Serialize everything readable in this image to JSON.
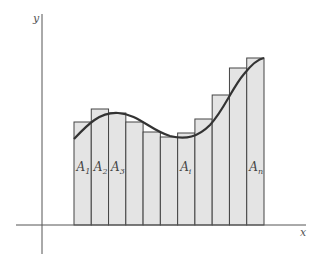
{
  "diagram": {
    "type": "riemann-sum-rectangles",
    "axes": {
      "x_label": "x",
      "y_label": "y"
    },
    "bars": [
      {
        "index": 1,
        "label_main": "A",
        "label_sub": "1",
        "top": 122
      },
      {
        "index": 2,
        "label_main": "A",
        "label_sub": "2",
        "top": 109
      },
      {
        "index": 3,
        "label_main": "A",
        "label_sub": "3",
        "top": 113
      },
      {
        "index": 4,
        "label_main": "",
        "label_sub": "",
        "top": 122
      },
      {
        "index": 5,
        "label_main": "",
        "label_sub": "",
        "top": 132
      },
      {
        "index": 6,
        "label_main": "",
        "label_sub": "",
        "top": 137
      },
      {
        "index": 7,
        "label_main": "A",
        "label_sub": "i",
        "top": 133
      },
      {
        "index": 8,
        "label_main": "",
        "label_sub": "",
        "top": 119
      },
      {
        "index": 9,
        "label_main": "",
        "label_sub": "",
        "top": 95
      },
      {
        "index": 10,
        "label_main": "",
        "label_sub": "",
        "top": 68
      },
      {
        "index": 11,
        "label_main": "A",
        "label_sub": "n",
        "top": 58
      }
    ],
    "colors": {
      "bar_fill": "#e4e4e4",
      "bar_stroke": "#444444",
      "curve": "#333333",
      "axis": "#555555"
    }
  }
}
